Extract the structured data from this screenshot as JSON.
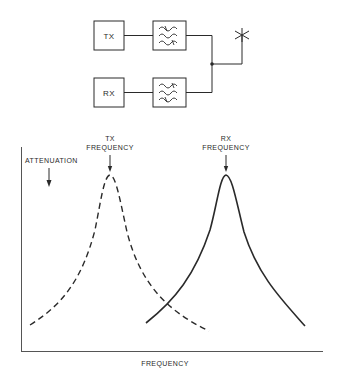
{
  "block_diagram": {
    "tx_label": "TX",
    "rx_label": "RX",
    "filter_icon": "bandpass-filter-icon",
    "antenna_icon": "antenna-icon"
  },
  "chart": {
    "y_axis_label": "ATTENUATION",
    "x_axis_label": "FREQUENCY",
    "tx_marker_line1": "TX",
    "tx_marker_line2": "FREQUENCY",
    "rx_marker_line1": "RX",
    "rx_marker_line2": "FREQUENCY"
  },
  "colors": {
    "ink": "#2a2a2a",
    "background": "#ffffff"
  }
}
